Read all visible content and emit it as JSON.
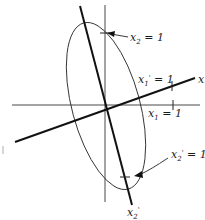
{
  "diagram": {
    "type": "coordinate-rotation-ellipse",
    "axes": {
      "original_x_label": "x₁",
      "original_y_label": "x₂",
      "rotated_x_label": "x",
      "rotated_y_label": "x₂'"
    },
    "annotations": [
      {
        "id": "x2_eq_1",
        "base": "x",
        "sub": "2",
        "prime": "",
        "rest": " = 1"
      },
      {
        "id": "x1p_eq_1",
        "base": "x",
        "sub": "1",
        "prime": "'",
        "rest": " = 1"
      },
      {
        "id": "x1_eq_1",
        "base": "x",
        "sub": "1",
        "prime": "",
        "rest": " = 1"
      },
      {
        "id": "x2p_eq_1",
        "base": "x",
        "sub": "2",
        "prime": "'",
        "rest": " = 1"
      }
    ],
    "end_labels": {
      "rotated_x_end": "x",
      "rotated_y_end_base": "x",
      "rotated_y_end_sub": "2",
      "rotated_y_end_prime": "'"
    },
    "colors": {
      "ink": "#1a1a1a",
      "background": "#ffffff"
    }
  }
}
